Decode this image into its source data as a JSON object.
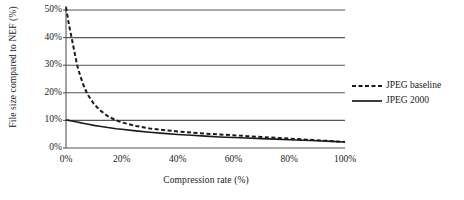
{
  "chart_data": {
    "type": "line",
    "title": "",
    "xlabel": "Compression rate (%)",
    "ylabel": "File size compared to NEF (%)",
    "xlim": [
      0,
      100
    ],
    "ylim": [
      0,
      50
    ],
    "grid": "horizontal",
    "legend_position": "right",
    "xticks": [
      "0%",
      "20%",
      "40%",
      "60%",
      "80%",
      "100%"
    ],
    "xtick_values": [
      0,
      20,
      40,
      60,
      80,
      100
    ],
    "yticks": [
      "0%",
      "10%",
      "20%",
      "30%",
      "40%",
      "50%"
    ],
    "ytick_values": [
      0,
      10,
      20,
      30,
      40,
      50
    ],
    "x": [
      0,
      1,
      2,
      3,
      4,
      5,
      6,
      7,
      8,
      10,
      12,
      15,
      18,
      20,
      25,
      30,
      35,
      40,
      45,
      50,
      55,
      60,
      65,
      70,
      75,
      80,
      85,
      90,
      95,
      100
    ],
    "series": [
      {
        "name": "JPEG baseline",
        "style": "dashed",
        "color": "#1a1a1a",
        "values": [
          51.0,
          45.0,
          40.0,
          35.0,
          30.0,
          26.5,
          23.5,
          21.0,
          19.0,
          16.0,
          13.8,
          11.5,
          10.0,
          9.3,
          8.0,
          7.1,
          6.5,
          6.0,
          5.6,
          5.2,
          4.9,
          4.6,
          4.3,
          4.0,
          3.7,
          3.4,
          3.1,
          2.8,
          2.5,
          2.2
        ]
      },
      {
        "name": "JPEG 2000",
        "style": "solid",
        "color": "#1a1a1a",
        "values": [
          10.2,
          10.0,
          9.8,
          9.6,
          9.4,
          9.2,
          9.0,
          8.8,
          8.6,
          8.2,
          7.9,
          7.4,
          7.0,
          6.8,
          6.2,
          5.7,
          5.3,
          4.9,
          4.6,
          4.3,
          4.0,
          3.8,
          3.6,
          3.4,
          3.2,
          3.0,
          2.8,
          2.6,
          2.4,
          2.2
        ]
      }
    ]
  },
  "axes": {
    "y_title": "File size compared to NEF (%)",
    "x_title": "Compression rate (%)"
  },
  "legend": {
    "items": [
      {
        "label": "JPEG baseline",
        "style": "dashed"
      },
      {
        "label": "JPEG 2000",
        "style": "solid"
      }
    ]
  },
  "colors": {
    "line": "#1a1a1a",
    "grid": "#555555",
    "axis": "#555555",
    "background": "#ffffff"
  }
}
